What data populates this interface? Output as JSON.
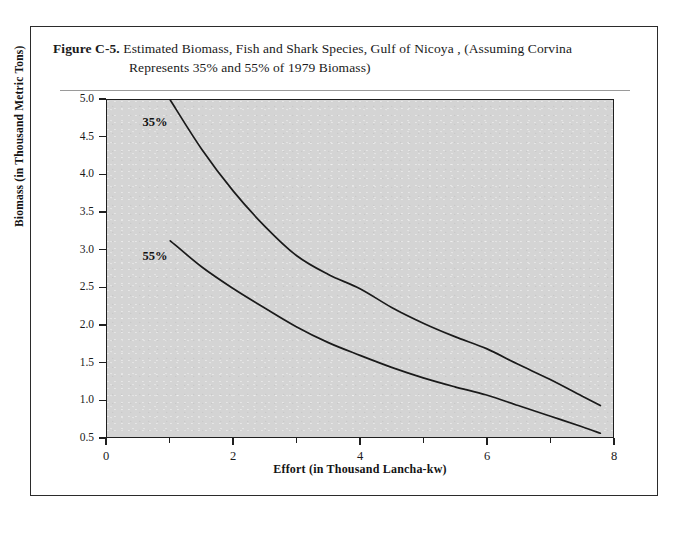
{
  "figure": {
    "label": "Figure C-5.",
    "caption_line1": "Estimated Biomass, Fish and Shark Species, Gulf of Nicoya , (Assuming Corvina",
    "caption_line2": "Represents 35% and 55% of 1979 Biomass)"
  },
  "chart_data": {
    "type": "line",
    "title": "Estimated Biomass, Fish and Shark Species, Gulf of Nicoya , (Assuming Corvina Represents 35% and 55% of 1979 Biomass)",
    "xlabel": "Effort (in Thousand Lancha-kw)",
    "ylabel": "Biomass (in Thousand Metric Tons)",
    "xlim": [
      0,
      8
    ],
    "ylim": [
      0.5,
      5.0
    ],
    "grid": false,
    "legend_position": "inline-annotation",
    "xticks": [
      0,
      2,
      4,
      6,
      8
    ],
    "xtick_labels": [
      "0",
      "2",
      "4",
      "6",
      "8"
    ],
    "xminor_ticks": [
      1,
      3,
      5,
      7
    ],
    "yticks": [
      0.5,
      1.0,
      1.5,
      2.0,
      2.5,
      3.0,
      3.5,
      4.0,
      4.5,
      5.0
    ],
    "ytick_labels": [
      "0.5",
      "1.0",
      "1.5",
      "2.0",
      "2.5",
      "3.0",
      "3.5",
      "4.0",
      "4.5",
      "5.0"
    ],
    "series": [
      {
        "name": "35%",
        "annotation": "35%",
        "x": [
          1.0,
          1.5,
          2.0,
          2.5,
          3.0,
          3.5,
          4.0,
          4.5,
          5.0,
          5.5,
          6.0,
          6.5,
          7.0,
          7.5,
          7.8
        ],
        "values": [
          5.0,
          4.34,
          3.78,
          3.31,
          2.92,
          2.67,
          2.48,
          2.23,
          2.02,
          1.84,
          1.68,
          1.47,
          1.27,
          1.05,
          0.92
        ]
      },
      {
        "name": "55%",
        "annotation": "55%",
        "x": [
          1.0,
          1.5,
          2.0,
          2.5,
          3.0,
          3.5,
          4.0,
          4.5,
          5.0,
          5.5,
          6.0,
          6.5,
          7.0,
          7.5,
          7.8
        ],
        "values": [
          3.12,
          2.77,
          2.48,
          2.22,
          1.97,
          1.76,
          1.59,
          1.43,
          1.29,
          1.17,
          1.06,
          0.92,
          0.78,
          0.64,
          0.55
        ]
      }
    ]
  },
  "style": {
    "plot_background": "#d4d4d4",
    "axis_color": "#1f1f1f",
    "curve_color": "#1a1a1a",
    "page_background": "#ffffff",
    "frame_color": "#2b2b2b"
  }
}
